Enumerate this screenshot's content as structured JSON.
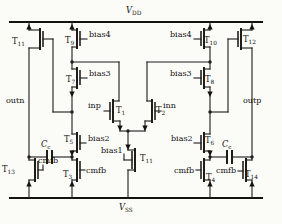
{
  "figure": {
    "rails": {
      "top": "VDD",
      "bottom": "VSS"
    },
    "wire_color": "#1e1c1a",
    "background": "#fbfbf8"
  },
  "labels": {
    "vdd": {
      "main": "V",
      "sub": "DD"
    },
    "vss": {
      "main": "V",
      "sub": "SS"
    },
    "cc": {
      "main": "C",
      "sub": "c"
    },
    "inp": "inp",
    "inn": "inn",
    "outn": "outn",
    "outp": "outp",
    "cmfb": "cmfb",
    "bias1": "bias1",
    "bias2": "bias2",
    "bias3": "bias3",
    "bias4": "bias4"
  },
  "transistors": {
    "t1": {
      "prefix": "T",
      "sub": "1"
    },
    "t2": {
      "prefix": "T",
      "sub": "2"
    },
    "t3": {
      "prefix": "T",
      "sub": "3"
    },
    "t4": {
      "prefix": "T",
      "sub": "4"
    },
    "t5": {
      "prefix": "T",
      "sub": "5"
    },
    "t6": {
      "prefix": "T",
      "sub": "6"
    },
    "t7": {
      "prefix": "T",
      "sub": "7"
    },
    "t8": {
      "prefix": "T",
      "sub": "8"
    },
    "t9": {
      "prefix": "T",
      "sub": "9"
    },
    "t10": {
      "prefix": "T",
      "sub": "10"
    },
    "t11_left": {
      "prefix": "T",
      "sub": "11"
    },
    "t11_tail": {
      "prefix": "T",
      "sub": "11"
    },
    "t12": {
      "prefix": "T",
      "sub": "12"
    },
    "t13": {
      "prefix": "T",
      "sub": "13"
    },
    "t14": {
      "prefix": "T",
      "sub": "14"
    }
  }
}
